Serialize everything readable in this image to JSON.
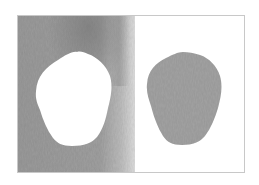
{
  "figure": {
    "frame": {
      "x": 17,
      "y": 15,
      "width": 228,
      "height": 158,
      "border_color": "#c8c8c8"
    },
    "left_panel": {
      "x": 17,
      "y": 15,
      "width": 118,
      "height": 158,
      "texture_base_color": "#9a9a9a",
      "texture_dark_color": "#7f7f7f",
      "texture_light_color": "#d9d9d9",
      "cutout_fill": "#ffffff"
    },
    "right_panel": {
      "x": 135,
      "y": 15,
      "width": 110,
      "height": 158,
      "background": "#ffffff",
      "piece_fill": "#a3a3a3"
    },
    "colors": {
      "background": "#ffffff",
      "texture": "#9a9a9a",
      "piece": "#a3a3a3"
    }
  }
}
